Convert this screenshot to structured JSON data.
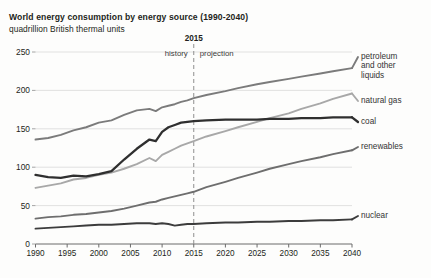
{
  "chart_data": {
    "type": "line",
    "title": "World energy consumption by energy source (1990-2040)",
    "subtitle": "quadrillion British thermal units",
    "xlabel": "",
    "ylabel": "",
    "ylim": [
      0,
      250
    ],
    "xlim": [
      1990,
      2040
    ],
    "yticks": [
      0,
      50,
      100,
      150,
      200,
      250
    ],
    "xticks": [
      1990,
      1995,
      2000,
      2005,
      2010,
      2015,
      2020,
      2025,
      2030,
      2035,
      2040
    ],
    "grid": true,
    "legend_position": "right-inline",
    "annotations": {
      "divider_year": "2015",
      "divider_x": 2015,
      "history_label": "history",
      "projection_label": "projection"
    },
    "x": [
      1990,
      1992,
      1994,
      1996,
      1998,
      2000,
      2002,
      2004,
      2006,
      2008,
      2009,
      2010,
      2011,
      2012,
      2013,
      2014,
      2015,
      2017,
      2020,
      2022,
      2025,
      2027,
      2030,
      2032,
      2035,
      2037,
      2040
    ],
    "series": [
      {
        "name": "petroleum and other liquids",
        "label": "petroleum and other liquids",
        "color": "#7b7b7b",
        "values": [
          136,
          138,
          142,
          148,
          152,
          158,
          161,
          168,
          174,
          176,
          173,
          178,
          180,
          182,
          185,
          187,
          190,
          194,
          199,
          203,
          208,
          211,
          215,
          218,
          222,
          225,
          229
        ]
      },
      {
        "name": "natural gas",
        "label": "natural gas",
        "color": "#a8a8a8",
        "values": [
          73,
          76,
          79,
          84,
          86,
          90,
          93,
          98,
          104,
          112,
          108,
          116,
          120,
          124,
          128,
          131,
          134,
          140,
          147,
          152,
          159,
          164,
          170,
          176,
          183,
          189,
          196
        ]
      },
      {
        "name": "coal",
        "label": "coal",
        "color": "#2f2f2f",
        "values": [
          90,
          87,
          86,
          89,
          88,
          91,
          95,
          110,
          124,
          136,
          134,
          146,
          152,
          155,
          158,
          159,
          160,
          161,
          162,
          162,
          162,
          163,
          163,
          164,
          164,
          165,
          165
        ]
      },
      {
        "name": "renewables",
        "label": "renewables",
        "color": "#6e6e6e",
        "values": [
          33,
          35,
          36,
          38,
          39,
          41,
          43,
          46,
          50,
          54,
          55,
          58,
          60,
          62,
          64,
          66,
          68,
          74,
          81,
          86,
          93,
          98,
          104,
          108,
          113,
          117,
          122
        ]
      },
      {
        "name": "nuclear",
        "label": "nuclear",
        "color": "#3c3c3c",
        "values": [
          20,
          21,
          22,
          23,
          24,
          25,
          25,
          26,
          27,
          27,
          26,
          27,
          26,
          24,
          25,
          26,
          26,
          27,
          28,
          28,
          29,
          29,
          30,
          30,
          31,
          31,
          32
        ]
      }
    ]
  }
}
